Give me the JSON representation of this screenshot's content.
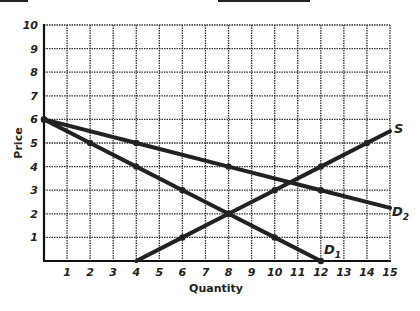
{
  "chart_data": {
    "type": "line",
    "title": "",
    "xlabel": "Quantity",
    "ylabel": "Price",
    "xlim": [
      0,
      15
    ],
    "ylim": [
      0,
      10
    ],
    "grid": true,
    "x_ticks": [
      "1",
      "2",
      "3",
      "4",
      "5",
      "6",
      "7",
      "8",
      "9",
      "10",
      "11",
      "12",
      "13",
      "14",
      "15"
    ],
    "y_ticks": [
      "1",
      "2",
      "3",
      "4",
      "5",
      "6",
      "7",
      "8",
      "9",
      "10"
    ],
    "series": [
      {
        "name": "S",
        "points": [
          [
            4,
            0
          ],
          [
            6,
            1
          ],
          [
            8,
            2
          ],
          [
            10,
            3
          ],
          [
            12,
            4
          ],
          [
            14,
            5
          ],
          [
            15,
            5.5
          ]
        ],
        "markers": [
          [
            6,
            1
          ],
          [
            8,
            2
          ],
          [
            10,
            3
          ],
          [
            12,
            4
          ],
          [
            14,
            5
          ]
        ]
      },
      {
        "name": "D1",
        "points": [
          [
            0,
            6
          ],
          [
            2,
            5
          ],
          [
            4,
            4
          ],
          [
            6,
            3
          ],
          [
            8,
            2
          ],
          [
            10,
            1
          ],
          [
            12,
            0
          ]
        ],
        "markers": [
          [
            0,
            6
          ],
          [
            2,
            5
          ],
          [
            4,
            4
          ],
          [
            6,
            3
          ],
          [
            8,
            2
          ],
          [
            10,
            1
          ],
          [
            12,
            0
          ]
        ]
      },
      {
        "name": "D2",
        "points": [
          [
            0,
            6
          ],
          [
            4,
            5
          ],
          [
            8,
            4
          ],
          [
            12,
            3
          ],
          [
            15,
            2.25
          ]
        ],
        "markers": [
          [
            0,
            6
          ],
          [
            4,
            5
          ],
          [
            8,
            4
          ],
          [
            12,
            3
          ]
        ]
      }
    ],
    "labels": {
      "S": "S",
      "D1_main": "D",
      "D1_sub": "1",
      "D2_main": "D",
      "D2_sub": "2"
    }
  },
  "colors": {
    "line": "#222222",
    "grid": "#333333",
    "background": "#ffffff"
  }
}
